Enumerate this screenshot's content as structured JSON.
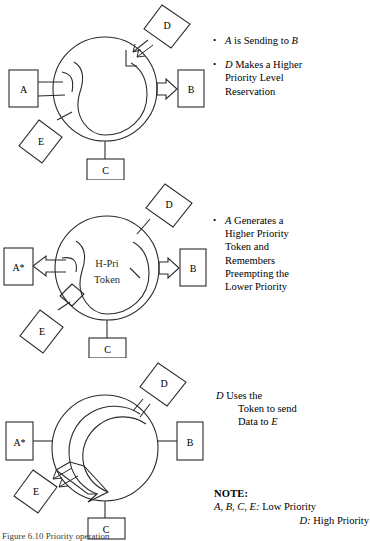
{
  "figure": {
    "caption": "Figure 6.10   Priority operation",
    "stroke_color": "#2b2b2b",
    "background": "#ffffff"
  },
  "diagrams": [
    {
      "id": "step-1",
      "nodes": [
        {
          "label": "A",
          "shape": "rect"
        },
        {
          "label": "B",
          "shape": "rect"
        },
        {
          "label": "C",
          "shape": "rect"
        },
        {
          "label": "D",
          "shape": "diamond"
        },
        {
          "label": "E",
          "shape": "diamond"
        }
      ],
      "center_label": ""
    },
    {
      "id": "step-2",
      "nodes": [
        {
          "label": "A*",
          "shape": "rect"
        },
        {
          "label": "B",
          "shape": "rect"
        },
        {
          "label": "C",
          "shape": "rect"
        },
        {
          "label": "D",
          "shape": "diamond"
        },
        {
          "label": "E",
          "shape": "diamond"
        }
      ],
      "center_label_line1": "H-Pri",
      "center_label_line2": "Token"
    },
    {
      "id": "step-3",
      "nodes": [
        {
          "label": "A*",
          "shape": "rect"
        },
        {
          "label": "B",
          "shape": "rect"
        },
        {
          "label": "C",
          "shape": "rect"
        },
        {
          "label": "D",
          "shape": "diamond"
        },
        {
          "label": "E",
          "shape": "diamond"
        }
      ],
      "center_label": ""
    }
  ],
  "annotations": {
    "step1": {
      "bullets": [
        {
          "lead": "A",
          "rest": " is Sending to ",
          "tail": "B"
        },
        {
          "lead": "D",
          "lines": [
            "Makes a Higher",
            "Priority Level",
            "Reservation"
          ]
        }
      ]
    },
    "step2": {
      "bullets": [
        {
          "lead": "A",
          "lines": [
            "Generates a",
            "Higher Priority",
            "Token and",
            "Remembers",
            "Preempting the",
            "Lower Priority"
          ]
        }
      ]
    },
    "step3": {
      "lead": "D",
      "lines": [
        "Uses the",
        "Token to send",
        "Data to "
      ],
      "tail": "E"
    }
  },
  "note": {
    "heading": "NOTE:",
    "row1_items": "A,  B,  C,  E:",
    "row1_value": "Low Priority",
    "row2_items": "D:",
    "row2_value": "High Priority"
  }
}
